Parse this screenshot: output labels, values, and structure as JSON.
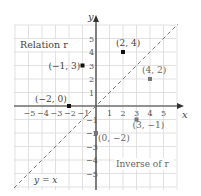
{
  "figure": {
    "labels": {
      "relation": "Relation r",
      "inverse": "Inverse of r",
      "line": "y = x",
      "x_axis": "x",
      "y_axis": "y"
    },
    "x_ticks": [
      "−5",
      "−4",
      "−3",
      "−2",
      "−1",
      "1",
      "2",
      "3",
      "4",
      "5"
    ],
    "y_ticks": [
      "5",
      "4",
      "3",
      "2",
      "1",
      "−1",
      "−2",
      "−3",
      "−4",
      "−5"
    ],
    "colors": {
      "grid": "#d9d9d9",
      "axis": "#333333",
      "relation_point": "#111111",
      "inverse_point": "#777777",
      "line": "#777777",
      "text": "#444444",
      "inverse_text": "#666666"
    },
    "relation_points": [
      {
        "label": "(2, 4)",
        "x": 2,
        "y": 4
      },
      {
        "label": "(−1, 3)",
        "x": -1,
        "y": 3
      },
      {
        "label": "(−2, 0)",
        "x": -2,
        "y": 0
      }
    ],
    "inverse_points": [
      {
        "label": "(4, 2)",
        "x": 4,
        "y": 2
      },
      {
        "label": "(3, −1)",
        "x": 3,
        "y": -1
      },
      {
        "label": "(0, −2)",
        "x": 0,
        "y": -2
      }
    ]
  }
}
